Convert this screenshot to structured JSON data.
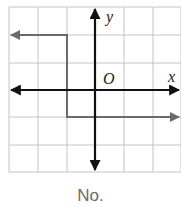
{
  "figure": {
    "axis_labels": {
      "x": "x",
      "y": "y",
      "origin": "O"
    },
    "caption": "No.",
    "colors": {
      "grid": "#c4c4c4",
      "axes": "#111111",
      "graph": "#6a6a6a",
      "caption": "#6b6b6b"
    },
    "grid": {
      "cols": 6,
      "rows": 6
    },
    "graph_segments": [
      {
        "from": [
          -1,
          2
        ],
        "to": [
          -3,
          2
        ],
        "arrow": "left"
      },
      {
        "from": [
          -1,
          2
        ],
        "to": [
          -1,
          -1
        ],
        "arrow": "none"
      },
      {
        "from": [
          -1,
          -1
        ],
        "to": [
          3,
          -1
        ],
        "arrow": "right"
      }
    ]
  }
}
